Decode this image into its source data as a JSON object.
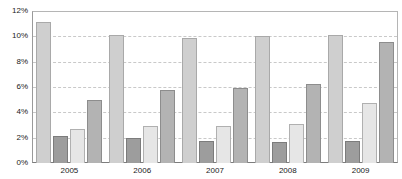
{
  "chart_data": {
    "type": "bar",
    "title": "",
    "subtitle": "",
    "xlabel": "",
    "ylabel": "",
    "categories": [
      "2005",
      "2006",
      "2007",
      "2008",
      "2009"
    ],
    "ylim": [
      0,
      12
    ],
    "ytick_values": [
      0,
      2,
      4,
      6,
      8,
      10,
      12
    ],
    "ytick_labels": [
      "0%",
      "2%",
      "4%",
      "6%",
      "8%",
      "10%",
      "12%"
    ],
    "grid": true,
    "grid_axis": "y",
    "legend": false,
    "legend_position": "none",
    "value_suffix": "%",
    "series": [
      {
        "name": "Series 1",
        "color": "#cfcfcf",
        "values": [
          11.1,
          10.1,
          9.9,
          10.0,
          10.1
        ]
      },
      {
        "name": "Series 2",
        "color": "#9d9d9d",
        "values": [
          2.15,
          1.95,
          1.75,
          1.65,
          1.75
        ]
      },
      {
        "name": "Series 3",
        "color": "#e6e6e6",
        "values": [
          2.65,
          2.9,
          2.9,
          3.05,
          4.7
        ]
      },
      {
        "name": "Series 4",
        "color": "#b3b3b3",
        "values": [
          4.95,
          5.8,
          5.9,
          6.25,
          9.55
        ]
      }
    ]
  }
}
